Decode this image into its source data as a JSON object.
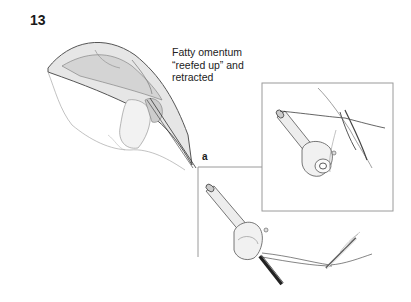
{
  "figure": {
    "number": "13",
    "annotation": "Fatty omentum\n“reefed up” and\nretracted",
    "panels": [
      {
        "label": "a",
        "description": "trocar with suture threaded through, tied with needle"
      },
      {
        "label": "b",
        "description": "trocar close-up with suture passing through tissue"
      }
    ],
    "colors": {
      "line": "#9a9a9a",
      "ink": "#333333",
      "shade": "#cfcfcf"
    }
  }
}
